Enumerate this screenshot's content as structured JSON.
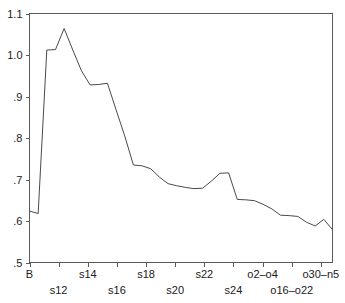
{
  "chart_data": {
    "type": "line",
    "title": "",
    "subtitle": "",
    "xlabel": "",
    "ylabel": "",
    "ylim": [
      0.5,
      1.1
    ],
    "grid": false,
    "legend": null,
    "y_ticks": [
      "1.1",
      "1.0",
      ".9",
      ".8",
      ".7",
      ".6",
      ".5"
    ],
    "y_tick_values": [
      1.1,
      1.0,
      0.9,
      0.8,
      0.7,
      0.6,
      0.5
    ],
    "x_tick_labels_upper": [
      "B",
      "s14",
      "s18",
      "s22",
      "o2–o4",
      "o30–n5"
    ],
    "x_tick_labels_lower": [
      "s12",
      "s16",
      "s20",
      "s24",
      "o16–o22"
    ],
    "x_tick_labels_ordered": [
      "B",
      "s12",
      "s14",
      "s16",
      "s18",
      "s20",
      "s22",
      "s24",
      "o2–o4",
      "o16–o22",
      "o30–n5"
    ],
    "x": [
      0,
      1,
      2,
      3,
      4,
      5,
      6,
      7,
      8,
      9,
      10,
      11,
      12,
      13,
      14,
      15,
      16,
      17,
      18,
      19,
      20,
      21,
      22,
      23,
      24,
      25,
      26,
      27,
      28,
      29,
      30,
      31,
      32,
      33,
      34,
      35
    ],
    "values": [
      0.624,
      0.618,
      1.012,
      1.013,
      1.064,
      1.012,
      0.962,
      0.928,
      0.929,
      0.932,
      0.868,
      0.805,
      0.735,
      0.733,
      0.726,
      0.706,
      0.69,
      0.685,
      0.681,
      0.678,
      0.679,
      0.696,
      0.715,
      0.716,
      0.652,
      0.651,
      0.649,
      0.64,
      0.629,
      0.614,
      0.613,
      0.611,
      0.597,
      0.588,
      0.604,
      0.579
    ],
    "line_color": "#4a4a4a",
    "axis_color": "#5a5a5a",
    "background_color": "#ffffff"
  },
  "accessibility": {
    "chart_description": "Line chart showing values declining from a peak near 1.06 to about 0.58"
  }
}
